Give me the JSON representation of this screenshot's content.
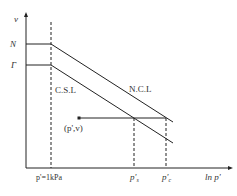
{
  "diagram": {
    "y_axis_label": "v",
    "x_axis_label": "ln p'",
    "y_ticks": [
      "N",
      "Γ"
    ],
    "lines": {
      "ncl_label": "N.C.L",
      "csl_label": "C.S.L"
    },
    "point_label": "(p',v)",
    "x_ticks": {
      "ref": "p'=1kPa",
      "ps_base": "p'",
      "ps_sub": "s",
      "pc_base": "p'",
      "pc_sub": "c"
    },
    "colors": {
      "line": "#222222",
      "text": "#333333"
    }
  }
}
